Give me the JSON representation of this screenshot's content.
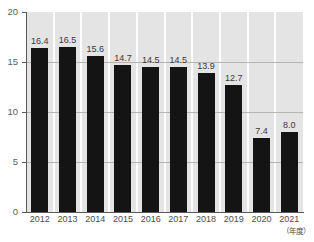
{
  "chart_data": {
    "type": "bar",
    "title": "",
    "subtitle": "",
    "xlabel": "（年度）",
    "ylabel": "",
    "categories": [
      "2012",
      "2013",
      "2014",
      "2015",
      "2016",
      "2017",
      "2018",
      "2019",
      "2020",
      "2021"
    ],
    "values": [
      16.4,
      16.5,
      15.6,
      14.7,
      14.5,
      14.5,
      13.9,
      12.7,
      7.4,
      8.0
    ],
    "value_labels": [
      "16.4",
      "16.5",
      "15.6",
      "14.7",
      "14.5",
      "14.5",
      "13.9",
      "12.7",
      "7.4",
      "8.0"
    ],
    "ylim": [
      0,
      20
    ],
    "y_ticks": [
      0,
      5,
      10,
      15,
      20
    ],
    "y_tick_labels": [
      "0",
      "5",
      "10",
      "15",
      "20"
    ],
    "grid": true,
    "grid_axis": "y",
    "legend": null,
    "legend_position": "none",
    "series": [
      {
        "name": "",
        "values": [
          16.4,
          16.5,
          15.6,
          14.7,
          14.5,
          14.5,
          13.9,
          12.7,
          7.4,
          8.0
        ]
      }
    ],
    "colors": {
      "bar": "#141414",
      "plot_background": "#e4e4e4",
      "figure_background": "#ffffff",
      "gridline": "#b4b4b4",
      "axis": "#5a5a5a",
      "tick_label": "#5d5d5d",
      "value_label": "#3a3a3a",
      "column_separator": "#fdfdfd"
    }
  }
}
